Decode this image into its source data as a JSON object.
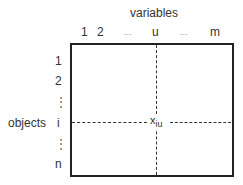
{
  "diagram": {
    "column_axis_label": "variables",
    "row_axis_label": "objects",
    "column_labels": [
      "1",
      "2",
      "...",
      "u",
      "...",
      "m"
    ],
    "row_labels": [
      "1",
      "2",
      "⋮",
      "i",
      "⋮",
      "n"
    ],
    "cell_label": {
      "base": "x",
      "subscript": "iu"
    }
  }
}
